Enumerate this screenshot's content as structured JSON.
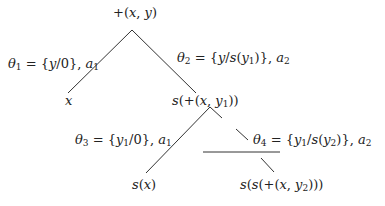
{
  "diagram": {
    "type": "derivation-tree",
    "nodes": {
      "root": "+(x, y)",
      "left_leaf": "x",
      "right_child": "s(+(x, y1))",
      "rc_left_leaf": "s(x)",
      "rc_right_leaf": "s(s(+(x, y2)))"
    },
    "edge_labels": {
      "theta1": "θ1 = {y/0}, a1",
      "theta2": "θ2 = {y/s(y1)}, a2",
      "theta3": "θ3 = {y1/0}, a1",
      "theta4": "θ4 = {y1/s(y2)}, a2"
    },
    "line_color": "#333333"
  }
}
